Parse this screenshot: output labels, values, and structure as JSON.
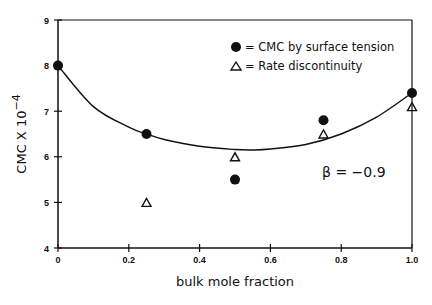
{
  "chart_data": {
    "type": "scatter",
    "title": "",
    "xlabel": "bulk mole fraction",
    "ylabel": "CMC X 10",
    "ylabel_exponent": "−4",
    "xlim": [
      0,
      1.0
    ],
    "ylim": [
      4,
      9
    ],
    "x_ticks": [
      0,
      0.2,
      0.4,
      0.6,
      0.8,
      1.0
    ],
    "x_tick_labels": [
      "0",
      "0.2",
      "0.4",
      "0.6",
      "0.8",
      "1.0"
    ],
    "y_ticks": [
      4,
      5,
      6,
      7,
      8,
      9
    ],
    "y_tick_labels": [
      "4",
      "5",
      "6",
      "7",
      "8",
      "9"
    ],
    "grid": false,
    "legend_position": "upper-right",
    "series": [
      {
        "name": "CMC by surface tension",
        "marker": "filled-circle",
        "x": [
          0,
          0.25,
          0.5,
          0.75,
          1.0
        ],
        "y": [
          8.0,
          6.5,
          5.5,
          6.8,
          7.4
        ]
      },
      {
        "name": "Rate discontinuity",
        "marker": "open-triangle",
        "x": [
          0.25,
          0.5,
          0.75,
          1.0
        ],
        "y": [
          5.0,
          6.0,
          6.5,
          7.1
        ]
      },
      {
        "name": "Fitted curve",
        "marker": "line",
        "x": [
          0,
          0.1,
          0.2,
          0.25,
          0.3,
          0.4,
          0.5,
          0.55,
          0.6,
          0.7,
          0.8,
          0.9,
          1.0
        ],
        "y": [
          8.0,
          7.1,
          6.65,
          6.5,
          6.38,
          6.23,
          6.16,
          6.15,
          6.17,
          6.27,
          6.5,
          6.87,
          7.4
        ]
      }
    ],
    "annotations": [
      {
        "text": "β = −0.9",
        "x": 0.85,
        "y": 5.7
      }
    ]
  },
  "legend": {
    "items": [
      {
        "symbol": "●",
        "label": "= CMC by surface tension"
      },
      {
        "symbol": "△",
        "label": "= Rate discontinuity"
      }
    ]
  },
  "annotation": {
    "beta": "β = −0.9"
  },
  "axes": {
    "xlabel": "bulk mole fraction",
    "ylabel_main": "CMC X 10",
    "ylabel_exp": "−4"
  },
  "colors": {
    "ink": "#111111",
    "background": "#ffffff"
  }
}
